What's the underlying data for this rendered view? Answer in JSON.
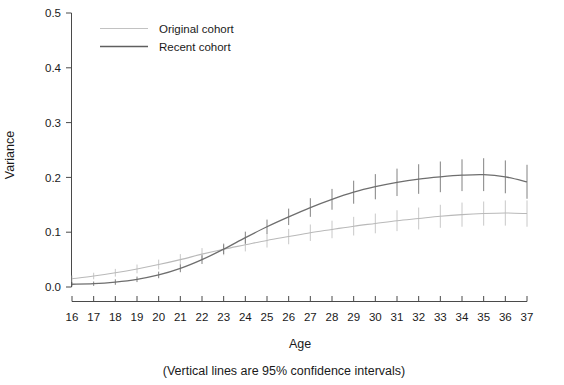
{
  "chart_data": {
    "type": "line",
    "title": "",
    "subtitle": "",
    "xlabel": "Age",
    "ylabel": "Variance",
    "caption": "(Vertical lines are 95% confidence intervals)",
    "grid": false,
    "legend_position": "top-left-inside",
    "xlim": [
      16,
      37
    ],
    "ylim": [
      0.0,
      0.5
    ],
    "x_tick_labels": [
      "16",
      "17",
      "18",
      "19",
      "20",
      "21",
      "22",
      "23",
      "24",
      "25",
      "26",
      "27",
      "28",
      "29",
      "30",
      "31",
      "32",
      "33",
      "34",
      "35",
      "36",
      "37"
    ],
    "y_tick_labels": [
      "0.0",
      "0.1",
      "0.2",
      "0.3",
      "0.4",
      "0.5"
    ],
    "y_ticks": [
      0.0,
      0.1,
      0.2,
      0.3,
      0.4,
      0.5
    ],
    "x": [
      16,
      17,
      18,
      19,
      20,
      21,
      22,
      23,
      24,
      25,
      26,
      27,
      28,
      29,
      30,
      31,
      32,
      33,
      34,
      35,
      36,
      37
    ],
    "series": [
      {
        "name": "Original cohort",
        "color": "#b9b9b9",
        "values": [
          0.015,
          0.02,
          0.026,
          0.033,
          0.041,
          0.05,
          0.06,
          0.069,
          0.077,
          0.085,
          0.092,
          0.099,
          0.105,
          0.111,
          0.116,
          0.121,
          0.125,
          0.129,
          0.132,
          0.134,
          0.135,
          0.134
        ],
        "ci_lower": [
          0.009,
          0.014,
          0.019,
          0.025,
          0.032,
          0.04,
          0.049,
          0.058,
          0.065,
          0.072,
          0.078,
          0.084,
          0.089,
          0.094,
          0.098,
          0.102,
          0.105,
          0.108,
          0.11,
          0.112,
          0.112,
          0.11
        ],
        "ci_upper": [
          0.021,
          0.026,
          0.033,
          0.041,
          0.05,
          0.06,
          0.071,
          0.08,
          0.089,
          0.098,
          0.106,
          0.114,
          0.121,
          0.128,
          0.134,
          0.14,
          0.145,
          0.15,
          0.154,
          0.156,
          0.158,
          0.158
        ]
      },
      {
        "name": "Recent cohort",
        "color": "#6e6e6e",
        "values": [
          0.005,
          0.006,
          0.009,
          0.014,
          0.022,
          0.034,
          0.05,
          0.069,
          0.09,
          0.11,
          0.128,
          0.145,
          0.16,
          0.173,
          0.183,
          0.191,
          0.197,
          0.201,
          0.204,
          0.205,
          0.201,
          0.192
        ],
        "ci_lower": [
          0.001,
          0.002,
          0.004,
          0.009,
          0.016,
          0.027,
          0.042,
          0.06,
          0.079,
          0.097,
          0.113,
          0.128,
          0.141,
          0.152,
          0.16,
          0.166,
          0.17,
          0.173,
          0.175,
          0.175,
          0.171,
          0.161
        ],
        "ci_upper": [
          0.009,
          0.01,
          0.014,
          0.019,
          0.028,
          0.041,
          0.058,
          0.078,
          0.101,
          0.123,
          0.143,
          0.162,
          0.179,
          0.194,
          0.206,
          0.216,
          0.224,
          0.229,
          0.233,
          0.235,
          0.231,
          0.223
        ]
      }
    ]
  },
  "legend": {
    "items": [
      {
        "label": "Original cohort"
      },
      {
        "label": "Recent cohort"
      }
    ]
  },
  "axes": {
    "x_title": "Age",
    "y_title": "Variance"
  },
  "caption": {
    "text": "(Vertical lines are 95% confidence intervals)"
  }
}
